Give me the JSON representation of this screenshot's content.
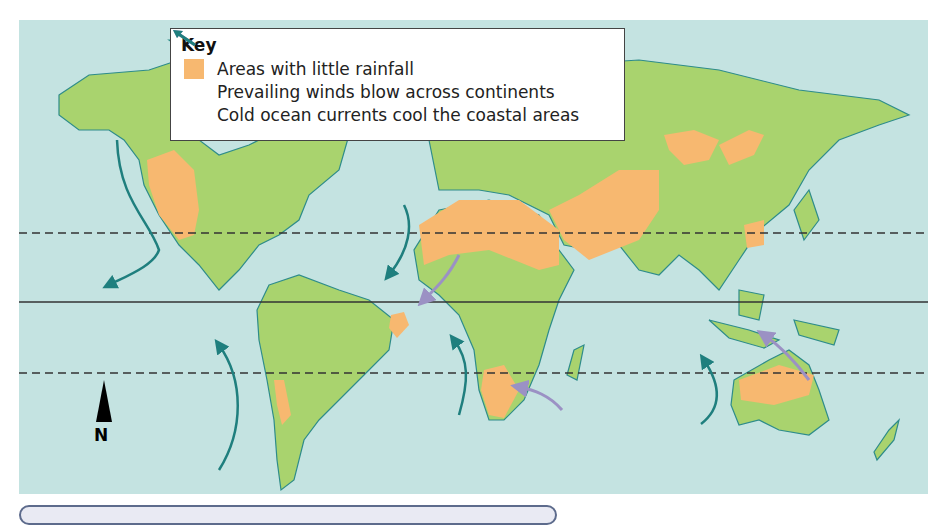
{
  "map": {
    "title": "World map of dry areas, prevailing winds and cold ocean currents",
    "colors": {
      "ocean": "#c4e3e1",
      "land": "#a9d36e",
      "coast": "#2e8c8a",
      "dry_area": "#f7b870",
      "wind_arrow": "#9b91c4",
      "current_arrow": "#1f7f7e",
      "lines": "#333333"
    },
    "lines": [
      {
        "name": "Tropic of Cancer",
        "style": "dashed"
      },
      {
        "name": "Equator",
        "style": "solid"
      },
      {
        "name": "Tropic of Capricorn",
        "style": "dashed"
      }
    ]
  },
  "key": {
    "title": "Key",
    "items": [
      {
        "symbol": "orange-swatch",
        "label": "Areas with little rainfall"
      },
      {
        "symbol": "purple-arrow",
        "label": "Prevailing winds blow across continents"
      },
      {
        "symbol": "teal-arrow",
        "label": "Cold ocean currents cool the coastal areas"
      }
    ]
  },
  "compass": {
    "label": "N"
  }
}
